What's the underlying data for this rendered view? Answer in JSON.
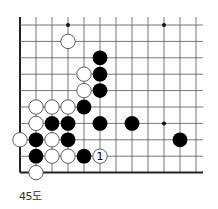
{
  "diagram": {
    "caption": "45도",
    "grid": {
      "x0": 20,
      "y0": 25,
      "step_x": 16,
      "step_y": 16.4,
      "cols": 12,
      "rows": 10,
      "right_extent": 203,
      "open_top": true,
      "open_right": true,
      "edge_left": true,
      "edge_bottom": true
    },
    "colors": {
      "line": "#555555",
      "edge": "#222222",
      "black_stone": "#000000",
      "white_stone_fill": "#ffffff",
      "white_stone_stroke": "#333333"
    },
    "star_points": [
      {
        "col": 3,
        "row": 0
      },
      {
        "col": 9,
        "row": 0
      },
      {
        "col": 9,
        "row": 6
      }
    ],
    "stones": [
      {
        "color": "white",
        "col": 3,
        "row": 1
      },
      {
        "color": "black",
        "col": 5,
        "row": 2
      },
      {
        "color": "white",
        "col": 4,
        "row": 3
      },
      {
        "color": "black",
        "col": 5,
        "row": 3
      },
      {
        "color": "white",
        "col": 4,
        "row": 4
      },
      {
        "color": "black",
        "col": 5,
        "row": 4
      },
      {
        "color": "white",
        "col": 1,
        "row": 5
      },
      {
        "color": "white",
        "col": 2,
        "row": 5
      },
      {
        "color": "white",
        "col": 3,
        "row": 5
      },
      {
        "color": "black",
        "col": 4,
        "row": 5
      },
      {
        "color": "white",
        "col": 1,
        "row": 6
      },
      {
        "color": "black",
        "col": 2,
        "row": 6
      },
      {
        "color": "black",
        "col": 3,
        "row": 6
      },
      {
        "color": "black",
        "col": 5,
        "row": 6
      },
      {
        "color": "black",
        "col": 7,
        "row": 6
      },
      {
        "color": "white",
        "col": 0,
        "row": 7
      },
      {
        "color": "black",
        "col": 1,
        "row": 7
      },
      {
        "color": "white",
        "col": 2,
        "row": 7
      },
      {
        "color": "black",
        "col": 3,
        "row": 7
      },
      {
        "color": "black",
        "col": 10,
        "row": 7
      },
      {
        "color": "black",
        "col": 1,
        "row": 8
      },
      {
        "color": "white",
        "col": 2,
        "row": 8
      },
      {
        "color": "white",
        "col": 3,
        "row": 8
      },
      {
        "color": "black",
        "col": 4,
        "row": 8
      },
      {
        "color": "white",
        "col": 5,
        "row": 8,
        "label": "1"
      },
      {
        "color": "white",
        "col": 1,
        "row": 9
      }
    ]
  }
}
